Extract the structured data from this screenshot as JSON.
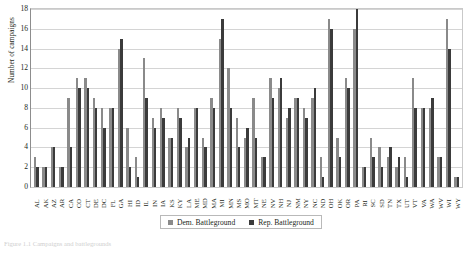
{
  "figure": {
    "caption": "Figure 1.1  Campaigns and battlegrounds"
  },
  "legend": {
    "position": "bottom-center",
    "items": [
      {
        "label": "Dem. Battleground",
        "color": "#8a8a8a",
        "swatch": "legend-swatch-dem"
      },
      {
        "label": "Rep. Battleground",
        "color": "#3b3b3b",
        "swatch": "legend-swatch-rep"
      }
    ]
  },
  "axes": {
    "ylabel": "Number of campaigns",
    "yticks": [
      "0",
      "2",
      "4",
      "6",
      "8",
      "10",
      "12",
      "14",
      "16",
      "18"
    ],
    "ymin": 0,
    "ymax": 18,
    "grid": true
  },
  "chart_data": {
    "type": "bar",
    "title": "",
    "xlabel": "",
    "ylabel": "Number of campaigns",
    "ylim": [
      0,
      18
    ],
    "ytick_step": 2,
    "grid": true,
    "legend_position": "bottom-center",
    "categories": [
      "AL",
      "AK",
      "AZ",
      "AR",
      "CA",
      "CO",
      "CT",
      "DE",
      "DC",
      "FL",
      "GA",
      "HI",
      "ID",
      "IL",
      "IN",
      "IA",
      "KS",
      "KY",
      "LA",
      "ME",
      "MD",
      "MA",
      "MI",
      "MN",
      "MS",
      "MO",
      "MT",
      "NE",
      "NV",
      "NH",
      "NJ",
      "NM",
      "NY",
      "NC",
      "ND",
      "OH",
      "OK",
      "OR",
      "PA",
      "RI",
      "SC",
      "SD",
      "TN",
      "TX",
      "UT",
      "VT",
      "VA",
      "WA",
      "WV",
      "WI",
      "WY"
    ],
    "series": [
      {
        "name": "Dem. Battleground",
        "color": "#8a8a8a",
        "values": [
          3,
          2,
          4,
          2,
          9,
          11,
          11,
          9,
          8,
          8,
          14,
          6,
          3,
          13,
          7,
          8,
          5,
          8,
          4,
          8,
          5,
          9,
          15,
          12,
          7,
          5,
          9,
          3,
          11,
          10,
          7,
          9,
          8,
          9,
          3,
          17,
          5,
          11,
          16,
          2,
          5,
          4,
          3,
          2,
          3,
          11,
          8,
          8,
          3,
          17,
          1
        ]
      },
      {
        "name": "Rep. Battleground",
        "color": "#3b3b3b",
        "values": [
          2,
          2,
          4,
          2,
          4,
          10,
          10,
          8,
          6,
          8,
          15,
          2,
          1,
          9,
          6,
          7,
          5,
          7,
          5,
          8,
          4,
          8,
          17,
          8,
          4,
          6,
          5,
          3,
          9,
          11,
          8,
          9,
          7,
          10,
          1,
          16,
          3,
          10,
          18,
          2,
          3,
          2,
          4,
          3,
          1,
          8,
          8,
          9,
          3,
          14,
          1
        ]
      }
    ]
  }
}
